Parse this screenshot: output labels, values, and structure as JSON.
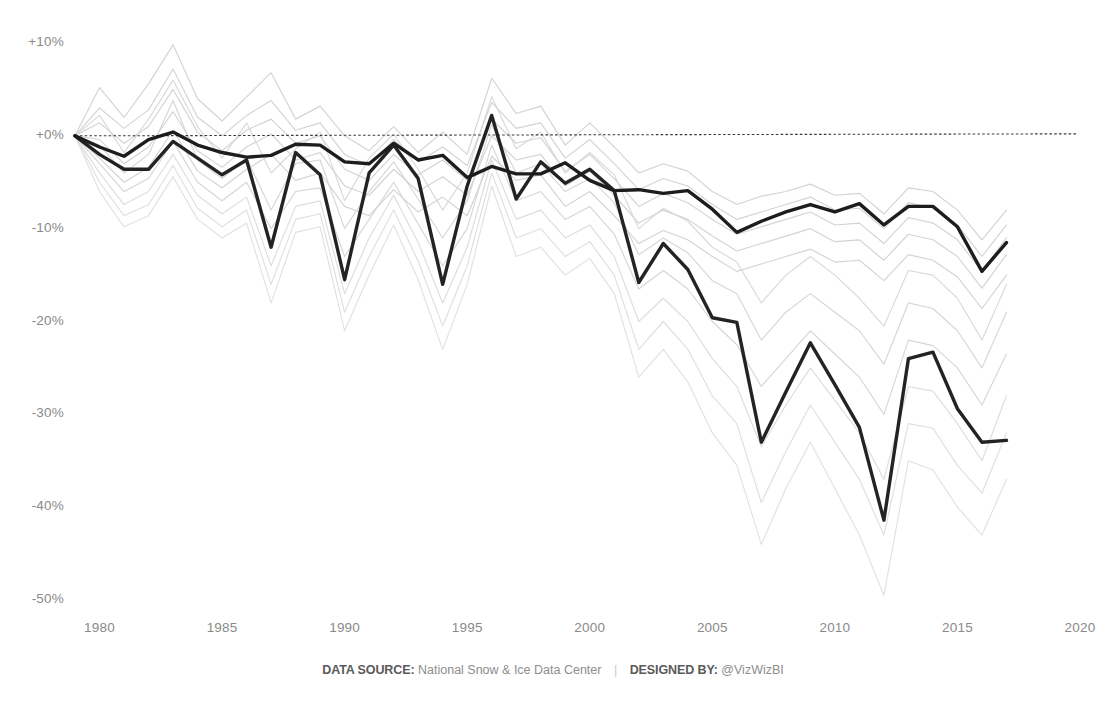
{
  "chart_data": {
    "type": "line",
    "title": "",
    "subtitle": "",
    "xlabel": "",
    "ylabel": "",
    "xlim": [
      1979,
      2020
    ],
    "ylim": [
      -50,
      10
    ],
    "grid": false,
    "legend_position": "none",
    "x_ticks": [
      "1980",
      "1985",
      "1990",
      "1995",
      "2000",
      "2005",
      "2010",
      "2015",
      "2020"
    ],
    "x_tick_values": [
      1980,
      1985,
      1990,
      1995,
      2000,
      2005,
      2010,
      2015,
      2020
    ],
    "y_ticks": [
      "+10%",
      "+0%",
      "-10%",
      "-20%",
      "-30%",
      "-40%",
      "-50%"
    ],
    "y_tick_values": [
      10,
      0,
      -10,
      -20,
      -30,
      -40,
      -50
    ],
    "reference_line": {
      "value": 0,
      "style": "dotted",
      "color": "#3a3a3a"
    },
    "colors": {
      "highlight": "#161616",
      "background_series": "#cfcfcf",
      "axis_text": "#8a8a8a",
      "footer_text": "#8d8d8d"
    },
    "x": [
      1979,
      1980,
      1981,
      1982,
      1983,
      1984,
      1985,
      1986,
      1987,
      1988,
      1989,
      1990,
      1991,
      1992,
      1993,
      1994,
      1995,
      1996,
      1997,
      1998,
      1999,
      2000,
      2001,
      2002,
      2003,
      2004,
      2005,
      2006,
      2007,
      2008,
      2009,
      2010,
      2011,
      2012,
      2013,
      2014,
      2015,
      2016,
      2017
    ],
    "series": [
      {
        "name": "highlight-upper",
        "emphasis": "highlight",
        "color": "#161616",
        "values": [
          0.0,
          -1.2,
          -2.2,
          -0.4,
          0.4,
          -1.0,
          -1.8,
          -2.3,
          -2.1,
          -0.9,
          -1.0,
          -2.8,
          -3.0,
          -0.8,
          -2.6,
          -2.1,
          -4.5,
          -3.3,
          -4.1,
          -4.1,
          -2.9,
          -4.8,
          -5.9,
          -5.8,
          -6.2,
          -5.9,
          -7.9,
          -10.4,
          -9.2,
          -8.2,
          -7.4,
          -8.2,
          -7.3,
          -9.6,
          -7.6,
          -7.6,
          -9.8,
          -14.6,
          -11.5
        ]
      },
      {
        "name": "highlight-lower",
        "emphasis": "highlight",
        "color": "#1c1c1c",
        "values": [
          0.0,
          -2.0,
          -3.6,
          -3.6,
          -0.6,
          -2.4,
          -4.2,
          -2.6,
          -12.0,
          -1.8,
          -4.2,
          -15.5,
          -4.0,
          -1.0,
          -4.6,
          -16.0,
          -5.4,
          2.2,
          -6.8,
          -2.8,
          -5.1,
          -3.6,
          -5.9,
          -15.8,
          -11.6,
          -14.4,
          -19.6,
          -20.1,
          -33.0,
          -27.6,
          -22.3,
          -26.8,
          -31.4,
          -41.4,
          -24.0,
          -23.3,
          -29.4,
          -33.0,
          -32.8
        ]
      },
      {
        "name": "region-1",
        "emphasis": "background",
        "color": "#cfcfcf",
        "values": [
          0.0,
          5.2,
          2.0,
          5.6,
          9.8,
          4.0,
          1.6,
          4.2,
          6.8,
          1.8,
          3.2,
          0.0,
          -1.6,
          1.0,
          -1.8,
          0.4,
          -2.0,
          6.2,
          2.4,
          3.2,
          -1.0,
          1.4,
          -1.2,
          -4.0,
          -3.0,
          -3.8,
          -6.0,
          -7.4,
          -6.5,
          -6.0,
          -5.2,
          -6.4,
          -6.2,
          -8.4,
          -5.6,
          -6.0,
          -8.0,
          -11.2,
          -8.0
        ]
      },
      {
        "name": "region-2",
        "emphasis": "background",
        "color": "#cfcfcf",
        "values": [
          0.0,
          3.0,
          0.8,
          2.8,
          7.2,
          2.0,
          0.0,
          2.2,
          3.8,
          0.6,
          1.4,
          -2.0,
          -3.2,
          -0.4,
          -2.8,
          -1.2,
          -3.2,
          3.6,
          0.8,
          1.4,
          -2.4,
          -0.4,
          -3.0,
          -5.8,
          -4.6,
          -5.4,
          -7.4,
          -9.0,
          -8.2,
          -7.4,
          -6.6,
          -8.0,
          -7.8,
          -10.0,
          -7.2,
          -7.8,
          -9.6,
          -13.0,
          -9.6
        ]
      },
      {
        "name": "region-3",
        "emphasis": "background",
        "color": "#cfcfcf",
        "values": [
          0.0,
          1.4,
          -0.8,
          1.0,
          5.0,
          0.4,
          -1.6,
          0.6,
          1.8,
          -0.8,
          0.0,
          -3.6,
          -4.8,
          -2.0,
          -4.2,
          -2.6,
          -4.8,
          1.8,
          -0.8,
          -0.2,
          -3.8,
          -2.0,
          -4.6,
          -7.6,
          -6.2,
          -7.2,
          -9.0,
          -10.6,
          -9.8,
          -9.0,
          -8.2,
          -9.6,
          -9.4,
          -11.6,
          -8.8,
          -9.4,
          -11.2,
          -14.6,
          -11.0
        ]
      },
      {
        "name": "region-4",
        "emphasis": "background",
        "color": "#cfcfcf",
        "values": [
          0.0,
          -0.4,
          -3.0,
          -1.2,
          2.6,
          -1.6,
          -3.4,
          -1.2,
          0.2,
          -2.6,
          -1.8,
          -5.4,
          -6.4,
          -3.6,
          -6.0,
          -4.4,
          -6.4,
          0.0,
          -2.6,
          -2.0,
          -5.4,
          -3.8,
          -6.4,
          -9.4,
          -8.0,
          -9.0,
          -10.8,
          -12.4,
          -11.6,
          -10.8,
          -10.0,
          -11.4,
          -11.2,
          -13.4,
          -10.6,
          -11.2,
          -13.0,
          -16.4,
          -12.8
        ]
      },
      {
        "name": "region-5",
        "emphasis": "background",
        "color": "#cfcfcf",
        "values": [
          0.0,
          -2.4,
          -5.0,
          -3.4,
          0.6,
          -3.8,
          -5.6,
          -3.6,
          -2.0,
          -4.8,
          -4.0,
          -7.6,
          -8.6,
          -5.8,
          -8.2,
          -6.6,
          -8.6,
          -2.2,
          -4.8,
          -4.2,
          -7.6,
          -6.0,
          -8.6,
          -11.6,
          -10.2,
          -11.2,
          -13.0,
          -14.6,
          -13.8,
          -13.0,
          -12.2,
          -13.6,
          -13.4,
          -15.6,
          -12.8,
          -13.4,
          -15.2,
          -18.6,
          -15.0
        ]
      },
      {
        "name": "region-6",
        "emphasis": "background",
        "color": "#d2d2d2",
        "values": [
          0.0,
          -1.0,
          -4.0,
          -2.0,
          3.8,
          -2.6,
          -4.6,
          -2.4,
          -8.0,
          -3.0,
          -2.6,
          -10.0,
          -6.0,
          -2.8,
          -6.8,
          -11.0,
          -7.0,
          1.2,
          -4.0,
          -3.0,
          -6.0,
          -4.6,
          -7.2,
          -12.8,
          -11.0,
          -12.6,
          -15.6,
          -17.0,
          -22.0,
          -19.0,
          -17.0,
          -19.0,
          -21.0,
          -24.6,
          -18.0,
          -18.6,
          -21.0,
          -25.0,
          -19.0
        ]
      },
      {
        "name": "region-7",
        "emphasis": "background",
        "color": "#d2d2d2",
        "values": [
          0.0,
          -3.0,
          -6.0,
          -4.6,
          -0.6,
          -5.0,
          -7.0,
          -5.0,
          -10.0,
          -6.0,
          -5.6,
          -13.0,
          -9.0,
          -5.0,
          -9.5,
          -14.0,
          -10.0,
          -1.0,
          -7.0,
          -6.0,
          -9.0,
          -7.6,
          -10.6,
          -16.5,
          -14.5,
          -16.5,
          -20.0,
          -22.5,
          -27.0,
          -24.0,
          -21.0,
          -23.5,
          -26.0,
          -30.0,
          -22.0,
          -22.6,
          -25.0,
          -29.0,
          -23.5
        ]
      },
      {
        "name": "region-8",
        "emphasis": "background",
        "color": "#d6d6d6",
        "values": [
          0.0,
          2.2,
          -1.8,
          1.8,
          6.0,
          1.0,
          -2.4,
          1.4,
          -4.0,
          -1.4,
          0.4,
          -7.0,
          -2.4,
          0.2,
          -3.6,
          -8.0,
          -4.0,
          4.2,
          -1.4,
          0.4,
          -4.0,
          -1.8,
          -4.2,
          -10.0,
          -7.8,
          -9.2,
          -12.0,
          -13.6,
          -18.0,
          -15.0,
          -13.0,
          -15.0,
          -17.5,
          -20.5,
          -14.5,
          -15.0,
          -17.5,
          -22.0,
          -16.0
        ]
      },
      {
        "name": "region-9",
        "emphasis": "background",
        "color": "#dadada",
        "values": [
          0.0,
          -4.0,
          -7.4,
          -6.0,
          -2.0,
          -6.4,
          -8.4,
          -6.6,
          -14.0,
          -7.6,
          -7.0,
          -17.0,
          -11.0,
          -6.4,
          -11.5,
          -18.0,
          -12.0,
          -2.6,
          -9.0,
          -8.0,
          -11.0,
          -9.6,
          -13.0,
          -20.0,
          -17.5,
          -20.0,
          -24.0,
          -27.0,
          -33.5,
          -29.0,
          -25.0,
          -28.5,
          -32.0,
          -37.0,
          -27.0,
          -27.5,
          -31.0,
          -35.0,
          -28.0
        ]
      },
      {
        "name": "region-10",
        "emphasis": "background",
        "color": "#dcdcdc",
        "values": [
          0.0,
          -5.0,
          -8.6,
          -7.4,
          -3.2,
          -7.8,
          -9.8,
          -8.0,
          -16.0,
          -9.0,
          -8.4,
          -19.0,
          -13.0,
          -8.0,
          -13.5,
          -20.5,
          -14.0,
          -4.0,
          -11.0,
          -10.0,
          -13.0,
          -11.4,
          -15.0,
          -23.0,
          -20.0,
          -23.0,
          -28.0,
          -31.0,
          -39.5,
          -34.0,
          -29.0,
          -33.0,
          -37.0,
          -43.0,
          -31.0,
          -31.5,
          -35.5,
          -38.5,
          -32.0
        ]
      },
      {
        "name": "region-11",
        "emphasis": "background",
        "color": "#dedede",
        "values": [
          0.0,
          -6.0,
          -9.8,
          -8.6,
          -4.4,
          -9.0,
          -11.0,
          -9.4,
          -18.0,
          -10.4,
          -9.8,
          -21.0,
          -15.0,
          -9.6,
          -15.5,
          -23.0,
          -16.0,
          -5.4,
          -13.0,
          -12.0,
          -15.0,
          -13.2,
          -17.0,
          -26.0,
          -23.0,
          -26.5,
          -32.0,
          -35.5,
          -44.0,
          -38.0,
          -33.0,
          -38.0,
          -43.0,
          -49.5,
          -35.0,
          -36.0,
          -40.0,
          -43.0,
          -37.0
        ]
      }
    ]
  },
  "footer": {
    "source_label": "DATA SOURCE:",
    "source_value": "National Snow & Ice Data Center",
    "separator": "|",
    "designer_label": "DESIGNED BY:",
    "designer_value": "@VizWizBI"
  }
}
